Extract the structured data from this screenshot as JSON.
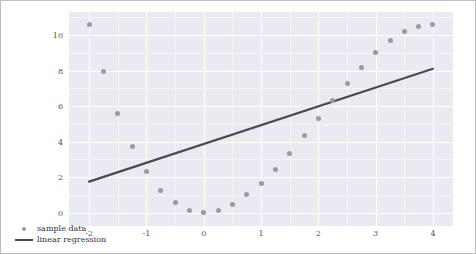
{
  "chart_data": {
    "type": "scatter",
    "title": "",
    "xlabel": "",
    "ylabel": "",
    "xlim": [
      -2.35,
      4.35
    ],
    "ylim": [
      -0.75,
      11.3
    ],
    "grid": true,
    "legend_position": "lower left",
    "xticks": [
      "-2",
      "-1",
      "0",
      "1",
      "2",
      "3",
      "4"
    ],
    "xtick_values": [
      -2,
      -1,
      0,
      1,
      2,
      3,
      4
    ],
    "yticks": [
      "0",
      "2",
      "4",
      "6",
      "8",
      "10"
    ],
    "ytick_values": [
      0,
      2,
      4,
      6,
      8,
      10
    ],
    "series": [
      {
        "name": "sample data",
        "type": "scatter",
        "color": "#9a9aa5",
        "marker": "circle",
        "x": [
          -2.0,
          -1.75,
          -1.5,
          -1.25,
          -1.0,
          -0.75,
          -0.5,
          -0.25,
          0.0,
          0.25,
          0.5,
          0.75,
          1.0,
          1.25,
          1.5,
          1.75,
          2.0,
          2.25,
          2.5,
          2.75,
          3.0,
          3.25,
          3.5,
          3.75,
          4.0
        ],
        "y": [
          10.6,
          7.95,
          5.6,
          3.75,
          2.3,
          1.25,
          0.55,
          0.15,
          0.0,
          0.15,
          0.45,
          1.0,
          1.65,
          2.45,
          3.35,
          4.35,
          5.3,
          6.3,
          7.25,
          8.2,
          9.0,
          9.7,
          10.2,
          10.5,
          10.6
        ]
      },
      {
        "name": "linear regression",
        "type": "line",
        "color": "#4a4a52",
        "x": [
          -2.0,
          4.0
        ],
        "y": [
          1.75,
          8.1
        ]
      }
    ],
    "legend": [
      {
        "label": "sample data",
        "key": "dot",
        "color": "#9a9aa5"
      },
      {
        "label": "linear regression",
        "key": "line",
        "color": "#4a4a52"
      }
    ]
  },
  "style": {
    "figure_background": "#ffffff",
    "axes_background": "#eaeaf2",
    "grid_color": "#ffffff",
    "tick_label_color": "#55555f",
    "border_color": "#bdbdbd"
  }
}
